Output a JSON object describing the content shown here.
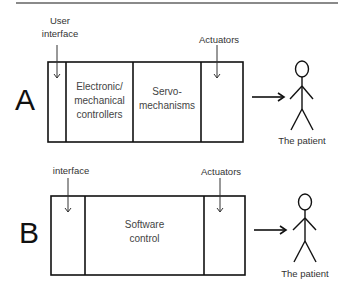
{
  "panels": [
    {
      "letter": "A",
      "labels": {
        "user_interface_line1": "User",
        "user_interface_line2": "interface",
        "actuators": "Actuators",
        "patient": "The patient"
      },
      "cells": [
        {
          "line1": "",
          "line2": "",
          "line3": ""
        },
        {
          "line1": "Electronic/",
          "line2": "mechanical",
          "line3": "controllers"
        },
        {
          "line1": "Servo-",
          "line2": "mechanisms"
        },
        {
          "line1": ""
        }
      ]
    },
    {
      "letter": "B",
      "labels": {
        "interface": "interface",
        "actuators": "Actuators",
        "patient": "The patient"
      },
      "cells": [
        {
          "line1": ""
        },
        {
          "line1": "Software",
          "line2": "control"
        },
        {
          "line1": ""
        }
      ]
    }
  ]
}
